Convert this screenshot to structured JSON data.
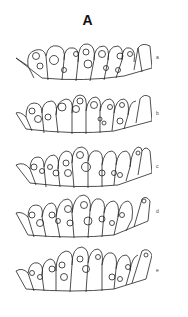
{
  "figure": {
    "panel_label": "A",
    "drawings": [
      {
        "label": "a",
        "top": 40,
        "label_top": 54
      },
      {
        "label": "b",
        "top": 91,
        "label_top": 110
      },
      {
        "label": "c",
        "top": 143,
        "label_top": 163
      },
      {
        "label": "d",
        "top": 193,
        "label_top": 208
      },
      {
        "label": "e",
        "top": 243,
        "label_top": 267
      }
    ],
    "line_color": "#222222",
    "background": "#ffffff"
  }
}
